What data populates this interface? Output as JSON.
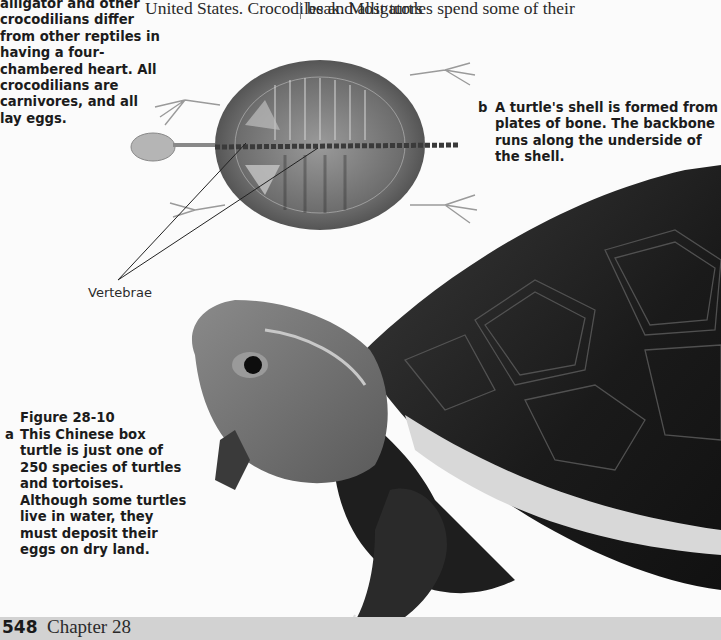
{
  "side_caption": {
    "text": "alligator and other crocodilians differ from other reptiles in having a four-chambered heart. All crocodilians are carnivores, and all lay eggs."
  },
  "body_text": {
    "left_column_line": "United States. Crocodiles and alligators",
    "right_column_line": "beak. Most turtles spend some of their"
  },
  "figure": {
    "number": "Figure 28-10",
    "caption_a": {
      "letter": "a",
      "text": "This Chinese box turtle is just one of 250 species of turtles and tortoises. Although some turtles live in water, they must deposit their eggs on dry land."
    },
    "caption_b": {
      "letter": "b",
      "text": "A turtle's shell is formed from plates of bone. The backbone runs along the underside of the shell."
    },
    "label_vertebrae": "Vertebrae",
    "images": {
      "xray": "turtle-skeleton-xray",
      "photo": "chinese-box-turtle-photo"
    }
  },
  "footer": {
    "page_number": "548",
    "chapter": "Chapter 28",
    "band_color": "#d2d2d2"
  }
}
